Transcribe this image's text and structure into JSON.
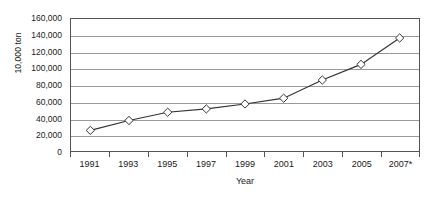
{
  "chart_data": {
    "type": "line",
    "title": "",
    "xlabel": "Year",
    "ylabel": "10,000 ton",
    "categories": [
      "1991",
      "1993",
      "1995",
      "1997",
      "1999",
      "2001",
      "2003",
      "2005",
      "2007*"
    ],
    "values": [
      25000,
      37000,
      47000,
      51000,
      57000,
      64000,
      86000,
      105000,
      137000
    ],
    "series": [
      {
        "name": "",
        "values": [
          25000,
          37000,
          47000,
          51000,
          57000,
          64000,
          86000,
          105000,
          137000
        ]
      }
    ],
    "ylim": [
      0,
      160000
    ],
    "ytick_labels": [
      "0",
      "20,000",
      "40,000",
      "60,000",
      "80,000",
      "100,000",
      "120,000",
      "140,000",
      "160,000"
    ],
    "ytick_values": [
      0,
      20000,
      40000,
      60000,
      80000,
      100000,
      120000,
      140000,
      160000
    ],
    "grid": true,
    "legend": false,
    "legend_position": "none",
    "marker": "diamond",
    "line_color": "#333333",
    "marker_fill": "#ffffff",
    "marker_stroke": "#333333",
    "grid_color": "#9a9a9a",
    "frame_color": "#555555",
    "footnote_marker": "*"
  }
}
